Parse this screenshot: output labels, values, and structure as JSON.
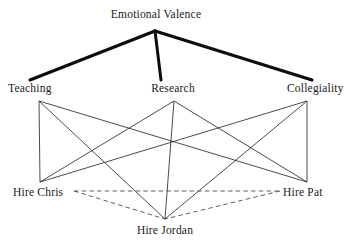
{
  "diagram": {
    "type": "hierarchical-bipartite-graph",
    "background_color": "#ffffff",
    "line_color": "#1a1a1a",
    "thick_line_color": "#000000",
    "dashed_line_color": "#555555",
    "levels": {
      "top": {
        "nodes": [
          {
            "id": "emotional-valence",
            "label": "Emotional Valence",
            "x": 155,
            "y": 31,
            "label_x": 156,
            "label_y": 8
          }
        ]
      },
      "middle": {
        "nodes": [
          {
            "id": "teaching",
            "label": "Teaching",
            "x": 39,
            "y": 101,
            "label_x": 34,
            "label_y": 82
          },
          {
            "id": "research",
            "label": "Research",
            "x": 174,
            "y": 101,
            "label_x": 173,
            "label_y": 82
          },
          {
            "id": "collegiality",
            "label": "Collegiality",
            "x": 307,
            "y": 101,
            "label_x": 315,
            "label_y": 82
          }
        ]
      },
      "bottom": {
        "nodes": [
          {
            "id": "hire-chris",
            "label": "Hire Chris",
            "x": 40,
            "y": 182,
            "label_x": 42,
            "label_y": 186
          },
          {
            "id": "hire-pat",
            "label": "Hire Pat",
            "x": 307,
            "y": 182,
            "label_x": 306,
            "label_y": 186
          },
          {
            "id": "hire-jordan",
            "label": "Hire Jordan",
            "x": 165,
            "y": 219,
            "label_x": 165,
            "label_y": 224
          }
        ]
      }
    },
    "edges_thick": [
      {
        "from": "emotional-valence",
        "to": "teaching",
        "x1": 155,
        "y1": 31,
        "x2": 30,
        "y2": 80
      },
      {
        "from": "emotional-valence",
        "to": "research",
        "x1": 155,
        "y1": 31,
        "x2": 161,
        "y2": 80
      },
      {
        "from": "emotional-valence",
        "to": "collegiality",
        "x1": 155,
        "y1": 31,
        "x2": 312,
        "y2": 80
      }
    ],
    "edges_thin": [
      {
        "from": "teaching",
        "to": "hire-chris",
        "x1": 39,
        "y1": 101,
        "x2": 40,
        "y2": 182
      },
      {
        "from": "teaching",
        "to": "hire-pat",
        "x1": 39,
        "y1": 101,
        "x2": 307,
        "y2": 182
      },
      {
        "from": "teaching",
        "to": "hire-jordan",
        "x1": 39,
        "y1": 101,
        "x2": 165,
        "y2": 219
      },
      {
        "from": "research",
        "to": "hire-chris",
        "x1": 174,
        "y1": 101,
        "x2": 40,
        "y2": 182
      },
      {
        "from": "research",
        "to": "hire-pat",
        "x1": 174,
        "y1": 101,
        "x2": 307,
        "y2": 182
      },
      {
        "from": "research",
        "to": "hire-jordan",
        "x1": 174,
        "y1": 101,
        "x2": 165,
        "y2": 219
      },
      {
        "from": "collegiality",
        "to": "hire-chris",
        "x1": 307,
        "y1": 101,
        "x2": 40,
        "y2": 182
      },
      {
        "from": "collegiality",
        "to": "hire-pat",
        "x1": 307,
        "y1": 101,
        "x2": 307,
        "y2": 182
      },
      {
        "from": "collegiality",
        "to": "hire-jordan",
        "x1": 307,
        "y1": 101,
        "x2": 165,
        "y2": 219
      }
    ],
    "edges_dashed": [
      {
        "from": "hire-chris",
        "to": "hire-pat",
        "x1": 74,
        "y1": 191,
        "x2": 280,
        "y2": 191
      },
      {
        "from": "hire-chris",
        "to": "hire-jordan",
        "x1": 74,
        "y1": 191,
        "x2": 165,
        "y2": 219
      },
      {
        "from": "hire-pat",
        "to": "hire-jordan",
        "x1": 280,
        "y1": 191,
        "x2": 165,
        "y2": 219
      }
    ]
  }
}
